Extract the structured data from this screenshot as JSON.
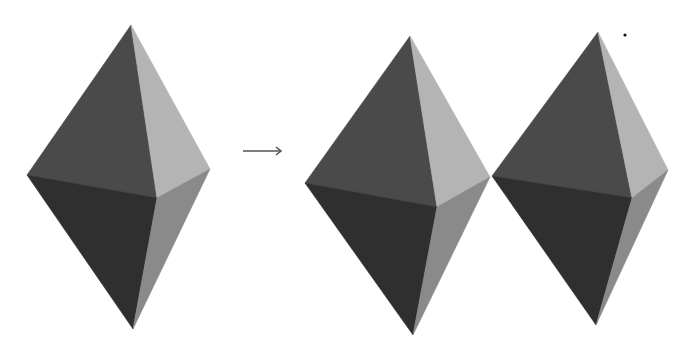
{
  "figure": {
    "arrow_glyph": "→",
    "colors": {
      "upper_left": "#4a4a4a",
      "upper_right": "#b4b4b4",
      "lower_left": "#2f2f2f",
      "lower_right": "#8a8a8a",
      "arrow": "#555555",
      "dot": "#111111",
      "background": "#ffffff"
    },
    "shapes": [
      {
        "name": "bipyramid-original",
        "top": [
          131,
          25
        ],
        "left": [
          27,
          175
        ],
        "right": [
          210,
          169
        ],
        "center": [
          157,
          198
        ],
        "bottom": [
          133,
          329
        ]
      },
      {
        "name": "bipyramid-copy-1",
        "top": [
          410,
          36
        ],
        "left": [
          305,
          183
        ],
        "right": [
          490,
          177
        ],
        "center": [
          437,
          207
        ],
        "bottom": [
          413,
          335
        ]
      },
      {
        "name": "bipyramid-copy-2",
        "top": [
          598,
          32
        ],
        "left": [
          492,
          176
        ],
        "right": [
          668,
          170
        ],
        "center": [
          632,
          198
        ],
        "bottom": [
          596,
          325
        ]
      }
    ],
    "arrow": {
      "x1": 243,
      "x2": 281,
      "y": 151
    },
    "dot": {
      "x": 625,
      "y": 35,
      "r": 1.6
    }
  }
}
